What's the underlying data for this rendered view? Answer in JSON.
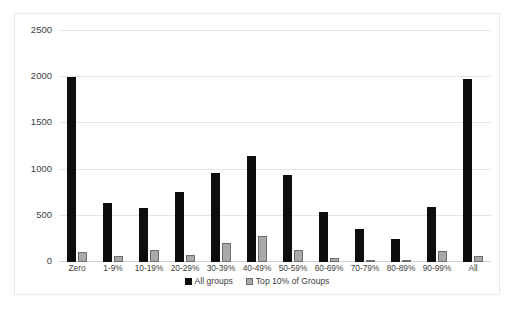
{
  "chart_data": {
    "type": "bar",
    "title": "",
    "xlabel": "",
    "ylabel": "",
    "ylim": [
      0,
      2500
    ],
    "yticks": [
      0,
      500,
      1000,
      1500,
      2000,
      2500
    ],
    "ytick_labels": [
      "0",
      "500",
      "1000",
      "1500",
      "2000",
      "2500"
    ],
    "grid": true,
    "legend_position": "bottom",
    "categories": [
      "Zero",
      "1-9%",
      "10-19%",
      "20-29%",
      "30-39%",
      "40-49%",
      "50-59%",
      "60-69%",
      "70-79%",
      "80-89%",
      "90-99%",
      "All"
    ],
    "series": [
      {
        "name": "All groups",
        "color": "#0d0d0d",
        "values": [
          2000,
          640,
          585,
          755,
          960,
          1145,
          940,
          540,
          355,
          245,
          595,
          1980
        ]
      },
      {
        "name": "Top 10% of Groups",
        "color": "#a9a9a9",
        "values": [
          110,
          70,
          130,
          80,
          210,
          285,
          135,
          40,
          15,
          20,
          115,
          65
        ]
      }
    ]
  },
  "legend": {
    "entries": [
      {
        "label": "All groups",
        "marker": "filled-square-black"
      },
      {
        "label": "Top 10% of Groups",
        "marker": "filled-square-gray"
      }
    ]
  },
  "colors": {
    "series_all": "#0d0d0d",
    "series_top": "#a9a9a9",
    "series_top_border": "#6e6e6e",
    "gridline": "#e4e4e4",
    "frame_border": "#e9e9e9",
    "text": "#404040",
    "background": "#ffffff"
  }
}
